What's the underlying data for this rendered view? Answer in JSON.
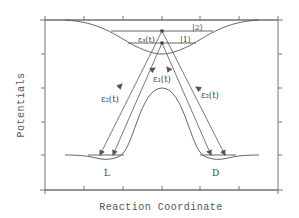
{
  "diagram": {
    "xlabel": "Reaction Coordinate",
    "ylabel": "Potentials",
    "labels": {
      "level2": "|2⟩",
      "level1": "|1⟩",
      "eps3": "ε₃(t)",
      "eps1": "ε₁(t)",
      "eps2_left": "ε₂(t)",
      "eps2_right": "ε₂(t)",
      "left_well": "L",
      "right_well": "D"
    },
    "colors": {
      "line": "#555555",
      "frame": "#666666",
      "background": "#ffffff"
    },
    "x_ticks": 7,
    "y_ticks": 6
  }
}
